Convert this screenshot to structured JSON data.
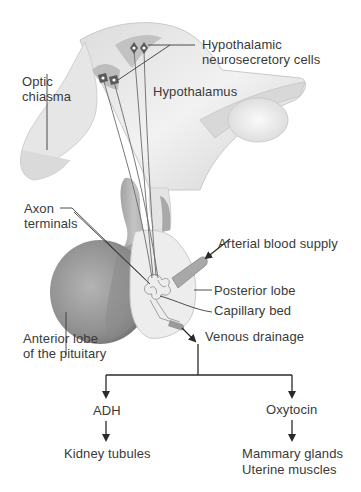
{
  "diagram": {
    "type": "anatomical-flow",
    "labels": {
      "hypothalamic_cells": [
        "Hypothalamic",
        "neurosecretory cells"
      ],
      "optic_chiasma": [
        "Optic",
        "chiasma"
      ],
      "hypothalamus": "Hypothalamus",
      "axon_terminals": [
        "Axon",
        "terminals"
      ],
      "arterial_supply": "Arterial blood supply",
      "posterior_lobe": "Posterior lobe",
      "capillary_bed": "Capillary bed",
      "anterior_lobe": [
        "Anterior lobe",
        "of the pituitary"
      ],
      "venous_drainage": "Venous drainage"
    },
    "flow": {
      "source": "Venous drainage",
      "branches": [
        {
          "hormone": "ADH",
          "targets": [
            "Kidney tubules"
          ]
        },
        {
          "hormone": "Oxytocin",
          "targets": [
            "Mammary glands",
            "Uterine muscles"
          ]
        }
      ]
    },
    "colors": {
      "text": "#3a3a3a",
      "line": "#2a2a2a",
      "tissue_light": "#ececec",
      "tissue_mid": "#c8c8c8",
      "anterior_lobe": "#9a9a9a"
    }
  }
}
